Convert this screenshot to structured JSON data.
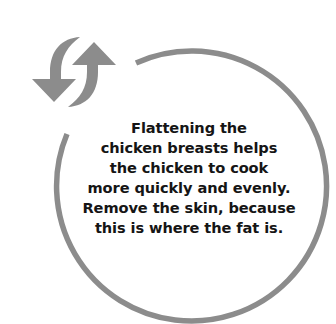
{
  "graphic": {
    "icon": "refresh-arrows-icon",
    "accent_color": "#8c8c8c",
    "text_color": "#151515",
    "background_color": "#ffffff"
  },
  "tip": {
    "lines": [
      "Flattening the",
      "chicken breasts helps",
      "the chicken to cook",
      "more quickly and evenly.",
      "Remove the skin, because",
      "this is where the fat is."
    ]
  }
}
